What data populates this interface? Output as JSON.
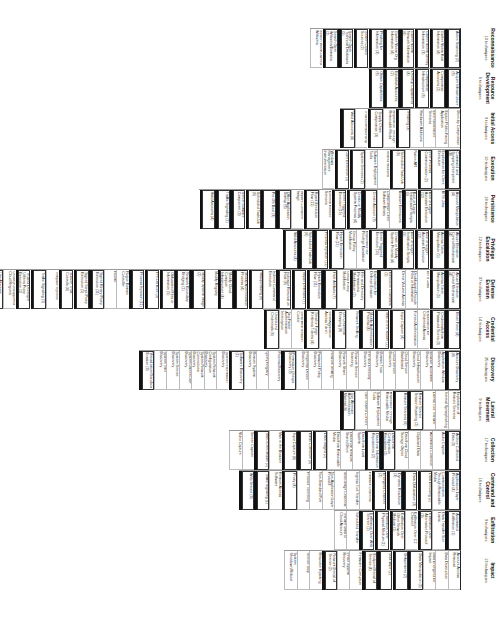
{
  "document": {
    "title": "ATT&CK Matrix for Enterprise",
    "orientation": "rotated-90-clockwise"
  },
  "tactics": [
    {
      "name": "Reconnaissance",
      "count": "10 techniques",
      "techniques": [
        "Active Scanning (2)",
        "Gather Victim Host Information (4)",
        "Gather Victim Identity Information (3)",
        "Gather Victim Network Information (6)",
        "Gather Victim Org Information (4)",
        "Phishing for Information (3)",
        "Search Closed Sources (2)",
        "Search Open Technical Databases (5)",
        "Search Open Websites/Domains (2)",
        "Search Victim-Owned Websites"
      ]
    },
    {
      "name": "Resource Development",
      "count": "6 techniques",
      "techniques": [
        "Acquire Infrastructure (6)",
        "Compromise Accounts (2)",
        "Compromise Infrastructure (6)",
        "Develop Capabilities (4)",
        "Establish Accounts (2)",
        "Obtain Capabilities (6)"
      ]
    },
    {
      "name": "Initial Access",
      "count": "9 techniques",
      "techniques": [
        "Drive-by Compromise",
        "Exploit Public-Facing Application",
        "External Remote Services",
        "Hardware Additions",
        "Phishing (3)",
        "Replication Through Removable Media",
        "Supply Chain Compromise (3)",
        "Trusted Relationship",
        "Valid Accounts (4)"
      ]
    },
    {
      "name": "Execution",
      "count": "10 techniques",
      "techniques": [
        "Command and Scripting Interpreter (8)",
        "Exploitation for Client Execution",
        "Inter-Process Communication (2)",
        "Native API",
        "Scheduled Task/Job (6)",
        "Shared Modules",
        "Software Deployment Tools",
        "System Services (2)",
        "User Execution (2)",
        "Windows Management Instrumentation"
      ]
    },
    {
      "name": "Persistence",
      "count": "18 techniques",
      "techniques": [
        "Account Manipulation (4)",
        "BITS Jobs",
        "Boot or Logon Autostart Execution (12)",
        "Boot or Logon Initialization Scripts (5)",
        "Browser Extensions",
        "Compromise Client Software Binary",
        "Create Account (3)",
        "Create or Modify System Process (4)",
        "Event Triggered Execution (15)",
        "External Remote Services",
        "Hijack Execution Flow (11)",
        "Implant Container Image",
        "Office Application Startup (6)",
        "Pre-OS Boot (3)",
        "Scheduled Task/Job (6)",
        "Server Software Component (3)",
        "Traffic Signaling (1)",
        "Valid Accounts (4)"
      ]
    },
    {
      "name": "Privilege Escalation",
      "count": "12 techniques",
      "techniques": [
        "Abuse Elevation Control Mechanism (4)",
        "Access Token Manipulation (5)",
        "Boot or Logon Autostart Execution (12)",
        "Boot or Logon Initialization Scripts (5)",
        "Create or Modify System Process (4)",
        "Event Triggered Execution (15)",
        "Exploitation for Privilege Escalation",
        "Group Policy Modification",
        "Hijack Execution Flow (11)",
        "Process Injection (11)",
        "Scheduled Task/Job (6)",
        "Valid Accounts (4)"
      ]
    },
    {
      "name": "Defense Evasion",
      "count": "37 techniques",
      "techniques": [
        "Abuse Elevation Control Mechanism (4)",
        "Access Token Manipulation (5)",
        "BITS Jobs",
        "Deobfuscate/Decode Files or Information",
        "Direct Volume Access",
        "Execution Guardrails (1)",
        "Exploitation for Defense Evasion",
        "File and Directory Permissions Modification (2)",
        "Group Policy Modification",
        "Hide Artifacts (7)",
        "Hijack Execution Flow (11)",
        "Impair Defenses (7)",
        "Indicator Removal on Host (6)",
        "Indirect Command Execution",
        "Masquerading (6)",
        "Modify Authentication Process (4)",
        "Modify Cloud Compute Infrastructure (4)",
        "Modify Registry",
        "Modify System Image (2)",
        "Network Boundary Bridging (1)",
        "Obfuscated Files or Information (5)",
        "Pre-OS Boot (3)",
        "Process Injection (11)",
        "Rogue Domain Controller",
        "Rootkit",
        "Signed Binary Proxy Execution (11)",
        "Signed Script Proxy Execution (1)",
        "Subvert Trust Controls (4)",
        "Template Injection",
        "Traffic Signaling (1)",
        "Trusted Developer Utilities Proxy Execution (1)",
        "Unused/Unsupported Cloud Regions",
        "Use Alternate Authentication Material (4)",
        "Valid Accounts (4)",
        "Virtualization/Sandbox Evasion (3)",
        "Weaken Encryption (2)",
        "XSL Script Processing"
      ]
    },
    {
      "name": "Credential Access",
      "count": "14 techniques",
      "techniques": [
        "Brute Force (4)",
        "Credentials from Password Stores (3)",
        "Exploitation for Credential Access",
        "Forced Authentication",
        "Input Capture (4)",
        "Man-in-the-Middle (2)",
        "Modify Authentication Process (4)",
        "Network Sniffing",
        "OS Credential Dumping (8)",
        "Steal Application Access Token",
        "Steal or Forge Kerberos Tickets (4)",
        "Steal Web Session Cookie",
        "Two-Factor Authentication Interception",
        "Unsecured Credentials (6)"
      ]
    },
    {
      "name": "Discovery",
      "count": "25 techniques",
      "techniques": [
        "Account Discovery (4)",
        "Application Window Discovery",
        "Browser Bookmark Discovery",
        "Cloud Infrastructure Discovery",
        "Cloud Service Dashboard",
        "Cloud Service Discovery",
        "Domain Trust Discovery",
        "File and Directory Discovery",
        "Network Service Scanning",
        "Network Share Discovery",
        "Network Sniffing",
        "Password Policy Discovery",
        "Peripheral Device Discovery",
        "Permission Groups Discovery (3)",
        "Process Discovery",
        "Query Registry",
        "Remote System Discovery",
        "Software Discovery (1)",
        "System Information Discovery",
        "System Network Configuration Discovery",
        "System Network Connections Discovery",
        "System Owner/User Discovery",
        "System Service Discovery",
        "System Time Discovery",
        "Virtualization/Sandbox Evasion (3)"
      ]
    },
    {
      "name": "Lateral Movement",
      "count": "9 techniques",
      "techniques": [
        "Exploitation of Remote Services",
        "Internal Spearphishing",
        "Lateral Tool Transfer",
        "Remote Service Session Hijacking (2)",
        "Remote Services (6)",
        "Replication Through Removable Media",
        "Software Deployment Tools",
        "Taint Shared Content",
        "Use Alternate Authentication Material (4)"
      ]
    },
    {
      "name": "Collection",
      "count": "17 techniques",
      "techniques": [
        "Archive Collected Data (3)",
        "Audio Capture",
        "Automated Collection",
        "Clipboard Data",
        "Data from Cloud Storage Object",
        "Data from Configuration Repository (2)",
        "Data from Information Repositories (2)",
        "Data from Local System",
        "Data from Network Shared Drive",
        "Data from Removable Media",
        "Data Staged (2)",
        "Email Collection (3)",
        "Input Capture (4)",
        "Man in the Browser",
        "Man-in-the-Middle (2)",
        "Screen Capture",
        "Video Capture"
      ]
    },
    {
      "name": "Command and Control",
      "count": "16 techniques",
      "techniques": [
        "Application Layer Protocol (4)",
        "Communication Through Removable Media",
        "Data Encoding (2)",
        "Data Obfuscation (3)",
        "Dynamic Resolution (3)",
        "Encrypted Channel (2)",
        "Fallback Channels",
        "Ingress Tool Transfer",
        "Multi-Stage Channels",
        "Non-Application Layer Protocol",
        "Non-Standard Port",
        "Protocol Tunneling",
        "Proxy (4)",
        "Remote Access Software",
        "Traffic Signaling (1)",
        "Web Service (3)"
      ]
    },
    {
      "name": "Exfiltration",
      "count": "9 techniques",
      "techniques": [
        "Automated Exfiltration (1)",
        "Data Transfer Size Limits",
        "Exfiltration Over Alternative Protocol (3)",
        "Exfiltration Over C2 Channel",
        "Exfiltration Over Other Network Medium (1)",
        "Exfiltration Over Physical Medium (1)",
        "Exfiltration Over Web Service (2)",
        "Scheduled Transfer",
        "Transfer Data to Cloud Account"
      ]
    },
    {
      "name": "Impact",
      "count": "13 techniques",
      "techniques": [
        "Account Access Removal",
        "Data Destruction",
        "Data Encrypted for Impact",
        "Data Manipulation (3)",
        "Defacement (2)",
        "Disk Wipe (2)",
        "Endpoint Denial of Service (4)",
        "Firmware Corruption",
        "Inhibit System Recovery",
        "Network Denial of Service (2)",
        "Resource Hijacking",
        "Service Stop",
        "System Shutdown/Reboot"
      ]
    }
  ],
  "colors": {
    "text": "#222222",
    "border": "#333333",
    "group_bar": "#111111",
    "background": "#ffffff"
  }
}
